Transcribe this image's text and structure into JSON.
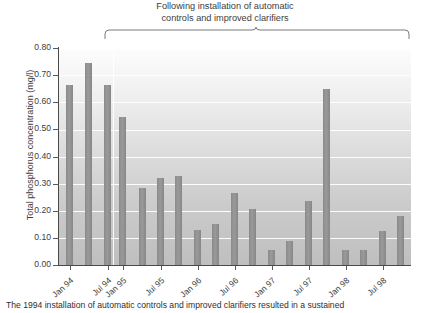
{
  "chart_data": {
    "type": "bar",
    "title": "Following installation of automatic\ncontrols and improved clarifiers",
    "xlabel": "",
    "ylabel": "Total phosphorus concentration (mg/l)",
    "ylim": [
      0.0,
      0.8
    ],
    "ytick_labels": [
      "0.80",
      "0.70",
      "0.60",
      "0.50",
      "0.40",
      "0.30",
      "0.20",
      "0.10",
      "0.00"
    ],
    "ytick_values": [
      0.8,
      0.7,
      0.6,
      0.5,
      0.4,
      0.3,
      0.2,
      0.1,
      0.0
    ],
    "xtick_labels": [
      "Jan 94",
      "Jul 94",
      "Jan 95",
      "Jul 95",
      "Jan 96",
      "Jul 96",
      "Jan 97",
      "Jul 97",
      "Jan 98",
      "Jul 98"
    ],
    "grid": true,
    "legend": "none",
    "series_name": "Total phosphorus concentration",
    "bar_color": "#909090",
    "values": [
      0.665,
      0.745,
      0.665,
      0.545,
      0.285,
      0.32,
      0.33,
      0.13,
      0.15,
      0.265,
      0.205,
      0.055,
      0.09,
      0.235,
      0.65,
      0.055,
      0.055,
      0.125,
      0.18
    ],
    "annotation": {
      "text": "Following installation of automatic controls and improved clarifiers",
      "bracket_start_label": "Jan 95",
      "bracket_end_label": "Jul 98"
    }
  },
  "bars": [
    {
      "label": "Jan 94",
      "value": 0.665,
      "x": 66
    },
    {
      "label": "Mar 94",
      "value": 0.745,
      "x": 85
    },
    {
      "label": "Jul 94",
      "value": 0.665,
      "x": 104
    },
    {
      "label": "Jan 95",
      "value": 0.545,
      "x": 119
    },
    {
      "label": "Apr 95",
      "value": 0.285,
      "x": 139
    },
    {
      "label": "Jul 95",
      "value": 0.32,
      "x": 157
    },
    {
      "label": "Oct 95",
      "value": 0.33,
      "x": 175
    },
    {
      "label": "Jan 96",
      "value": 0.13,
      "x": 194
    },
    {
      "label": "Apr 96",
      "value": 0.15,
      "x": 212
    },
    {
      "label": "Jul 96",
      "value": 0.265,
      "x": 231
    },
    {
      "label": "Oct 96",
      "value": 0.205,
      "x": 249
    },
    {
      "label": "Jan 97",
      "value": 0.055,
      "x": 268
    },
    {
      "label": "Apr 97",
      "value": 0.09,
      "x": 286
    },
    {
      "label": "Jul 97",
      "value": 0.235,
      "x": 305
    },
    {
      "label": "Oct 97",
      "value": 0.65,
      "x": 323
    },
    {
      "label": "Jan 98",
      "value": 0.055,
      "x": 342
    },
    {
      "label": "Apr 98",
      "value": 0.055,
      "x": 360
    },
    {
      "label": "Jul 98",
      "value": 0.125,
      "x": 379
    },
    {
      "label": "Oct 98",
      "value": 0.18,
      "x": 397
    }
  ],
  "caption": {
    "text": "The 1994 installation of automatic controls and improved clarifiers resulted in a sustained"
  }
}
